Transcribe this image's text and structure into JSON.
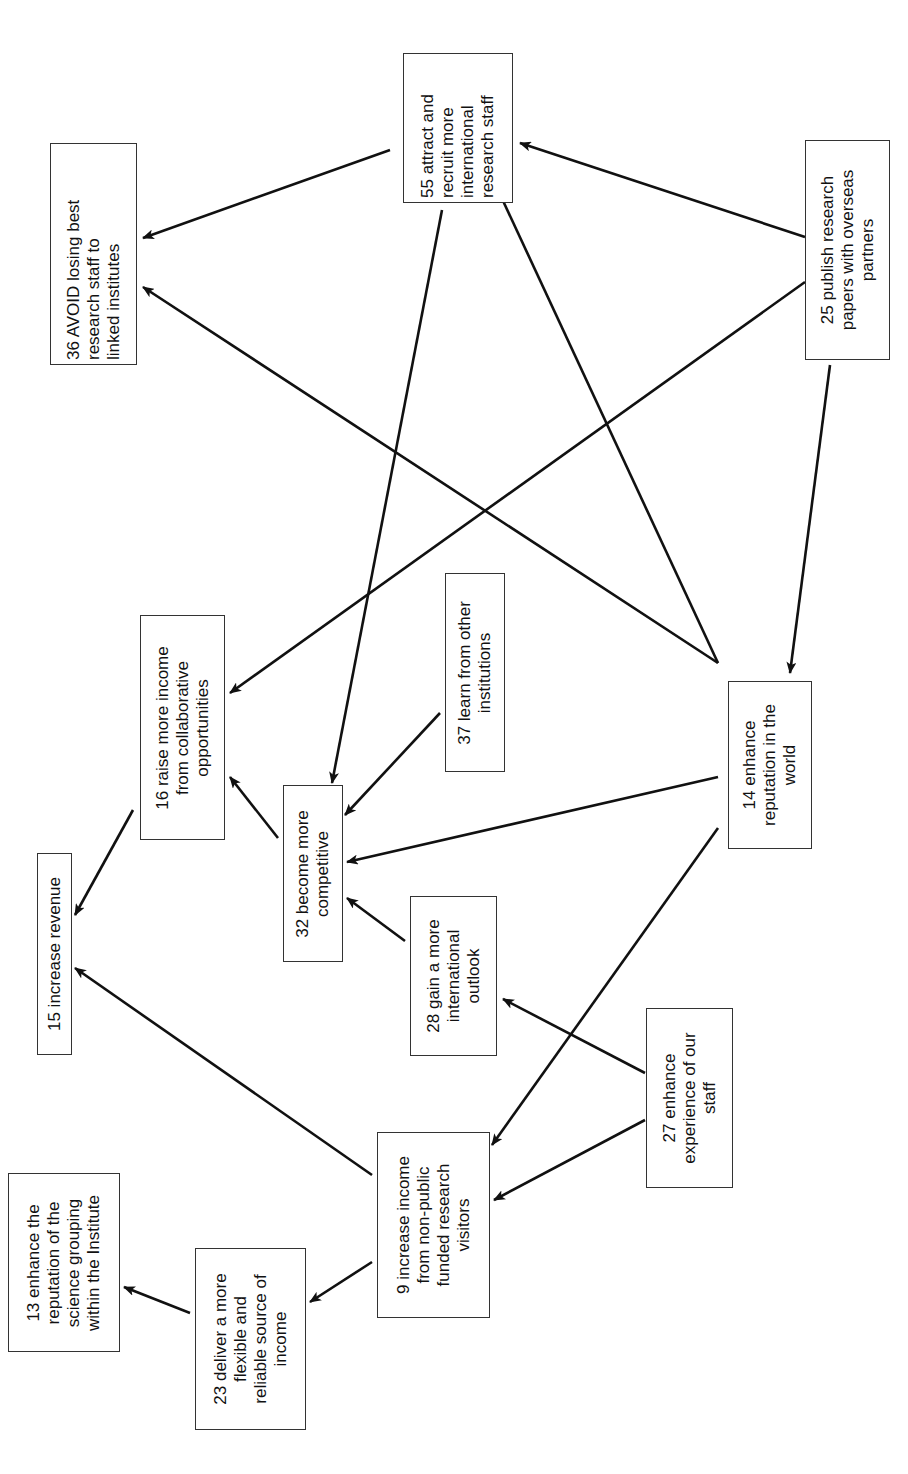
{
  "diagram": {
    "type": "cognitive-map",
    "orientation": "rotated-90-ccw",
    "line_color": "#111111",
    "box_border_color": "#333333",
    "nodes": [
      {
        "id": "36",
        "label": "36 AVOID losing best\nresearch staff to\nlinked institutes",
        "x": 50,
        "y": 143,
        "w": 87,
        "h": 222,
        "text_w": 222,
        "align": "left"
      },
      {
        "id": "55",
        "label": "55 attract and\nrecruit more\ninternational\nresearch staff",
        "x": 403,
        "y": 53,
        "w": 110,
        "h": 150,
        "text_w": 150,
        "align": "left"
      },
      {
        "id": "25",
        "label": "25 publish research\npapers with overseas\npartners",
        "x": 805,
        "y": 140,
        "w": 85,
        "h": 220,
        "text_w": 220,
        "align": "center"
      },
      {
        "id": "16",
        "label": "16 raise more income\nfrom collaborative\nopportunities",
        "x": 140,
        "y": 615,
        "w": 85,
        "h": 225,
        "text_w": 225,
        "align": "center"
      },
      {
        "id": "37",
        "label": "37 learn from other\ninstitutions",
        "x": 445,
        "y": 573,
        "w": 60,
        "h": 199,
        "text_w": 199,
        "align": "center"
      },
      {
        "id": "32",
        "label": "32 become more\ncompetitive",
        "x": 283,
        "y": 785,
        "w": 60,
        "h": 177,
        "text_w": 177,
        "align": "center"
      },
      {
        "id": "14",
        "label": "14 enhance\nreputation in the\nworld",
        "x": 728,
        "y": 681,
        "w": 84,
        "h": 168,
        "text_w": 168,
        "align": "center"
      },
      {
        "id": "15",
        "label": "15 increase revenue",
        "x": 37,
        "y": 853,
        "w": 35,
        "h": 202,
        "text_w": 202,
        "align": "center"
      },
      {
        "id": "28",
        "label": "28 gain a more\ninternational\noutlook",
        "x": 410,
        "y": 896,
        "w": 87,
        "h": 160,
        "text_w": 160,
        "align": "center"
      },
      {
        "id": "27",
        "label": "27 enhance\nexperience of our\nstaff",
        "x": 646,
        "y": 1008,
        "w": 87,
        "h": 180,
        "text_w": 180,
        "align": "center"
      },
      {
        "id": "9",
        "label": "9 increase income\nfrom non-public\nfunded research\nvisitors",
        "x": 377,
        "y": 1132,
        "w": 113,
        "h": 186,
        "text_w": 186,
        "align": "center"
      },
      {
        "id": "23",
        "label": "23 deliver a more\nflexible and\nreliable source of\nincome",
        "x": 195,
        "y": 1248,
        "w": 111,
        "h": 182,
        "text_w": 182,
        "align": "center"
      },
      {
        "id": "13",
        "label": "13 enhance the\nreputation of the\nscience grouping\nwithin the Institute",
        "x": 8,
        "y": 1173,
        "w": 112,
        "h": 179,
        "text_w": 179,
        "align": "center"
      }
    ],
    "edges": [
      {
        "from": "55",
        "to": "36",
        "x1": 390,
        "y1": 150,
        "x2": 143,
        "y2": 238
      },
      {
        "from": "14",
        "to": "36",
        "x1": 718,
        "y1": 663,
        "x2": 143,
        "y2": 287
      },
      {
        "from": "25",
        "to": "55",
        "x1": 805,
        "y1": 237,
        "x2": 520,
        "y2": 143
      },
      {
        "from": "25",
        "to": "16",
        "x1": 805,
        "y1": 282,
        "x2": 230,
        "y2": 693
      },
      {
        "from": "25",
        "to": "14",
        "x1": 830,
        "y1": 365,
        "x2": 790,
        "y2": 673
      },
      {
        "from": "14",
        "to": "55",
        "x1": 718,
        "y1": 663,
        "x2": 498,
        "y2": 190
      },
      {
        "from": "55",
        "to": "32",
        "x1": 442,
        "y1": 210,
        "x2": 332,
        "y2": 783
      },
      {
        "from": "37",
        "to": "32",
        "x1": 440,
        "y1": 713,
        "x2": 345,
        "y2": 815
      },
      {
        "from": "32",
        "to": "16",
        "x1": 278,
        "y1": 838,
        "x2": 230,
        "y2": 777
      },
      {
        "from": "14",
        "to": "32",
        "x1": 718,
        "y1": 777,
        "x2": 347,
        "y2": 862
      },
      {
        "from": "16",
        "to": "15",
        "x1": 133,
        "y1": 810,
        "x2": 75,
        "y2": 915
      },
      {
        "from": "28",
        "to": "32",
        "x1": 405,
        "y1": 941,
        "x2": 347,
        "y2": 898
      },
      {
        "from": "14",
        "to": "9",
        "x1": 718,
        "y1": 828,
        "x2": 492,
        "y2": 1145
      },
      {
        "from": "27",
        "to": "28",
        "x1": 645,
        "y1": 1073,
        "x2": 503,
        "y2": 999
      },
      {
        "from": "27",
        "to": "9",
        "x1": 645,
        "y1": 1120,
        "x2": 494,
        "y2": 1200
      },
      {
        "from": "9",
        "to": "15",
        "x1": 372,
        "y1": 1175,
        "x2": 75,
        "y2": 968
      },
      {
        "from": "9",
        "to": "23",
        "x1": 372,
        "y1": 1262,
        "x2": 310,
        "y2": 1302
      },
      {
        "from": "23",
        "to": "13",
        "x1": 190,
        "y1": 1313,
        "x2": 124,
        "y2": 1287
      }
    ]
  }
}
